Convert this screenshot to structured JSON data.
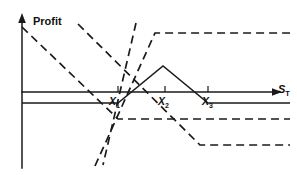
{
  "figure": {
    "name": "butterfly-spread-profit-diagram",
    "background_color": "#ffffff",
    "line_color": "#1a1a1a"
  },
  "axes": {
    "y_label": "Profit",
    "x_label": "S",
    "x_label_sub": "T",
    "x_axis_y_px": 92,
    "y_axis_x_px": 22
  },
  "ticks": [
    {
      "label": "X",
      "sub": "1",
      "x_px": 118
    },
    {
      "label": "X",
      "sub": "2",
      "x_px": 165
    },
    {
      "label": "X",
      "sub": "3",
      "x_px": 208
    }
  ],
  "chart_data": {
    "type": "line",
    "title": "",
    "subtitle": "",
    "xlabel": "S_T",
    "ylabel": "Profit",
    "grid": false,
    "legend": "none",
    "xlim": [
      0,
      297
    ],
    "ylim": [
      175,
      0
    ],
    "axis_note": "Coordinates are in pixel space; y increases downward. Profit = 0 at y = 92.",
    "annotations": [
      {
        "text": "Profit",
        "x": 33,
        "y": 16
      },
      {
        "text": "S_T",
        "x": 278,
        "y": 84
      },
      {
        "text": "X_1",
        "x": 109,
        "y": 96
      },
      {
        "text": "X_2",
        "x": 158,
        "y": 96
      },
      {
        "text": "X_3",
        "x": 202,
        "y": 96
      }
    ],
    "series": [
      {
        "name": "butterfly-spread-total-payoff",
        "style": "solid",
        "points": [
          [
            22,
            103
          ],
          [
            118,
            103
          ],
          [
            163,
            66
          ],
          [
            208,
            103
          ],
          [
            290,
            103
          ]
        ]
      },
      {
        "name": "short-call-low-strike-payoff",
        "style": "dashed",
        "points": [
          [
            22,
            27
          ],
          [
            118,
            119
          ],
          [
            290,
            119
          ]
        ]
      },
      {
        "name": "long-call-mid-strike-payoff-upper",
        "style": "dashed",
        "points": [
          [
            78,
            24
          ],
          [
            200,
            145
          ],
          [
            290,
            145
          ]
        ]
      },
      {
        "name": "short-call-mid-strike-payoff",
        "style": "dashed",
        "points": [
          [
            95,
            166
          ],
          [
            155,
            33
          ],
          [
            290,
            33
          ]
        ]
      },
      {
        "name": "long-call-high-strike-payoff",
        "style": "dashed",
        "points": [
          [
            136,
            23
          ],
          [
            103,
            165
          ]
        ]
      }
    ]
  }
}
